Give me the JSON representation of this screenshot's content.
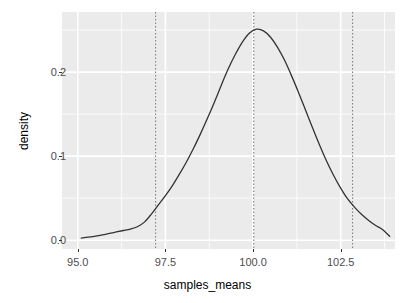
{
  "chart_data": {
    "type": "line",
    "title": "",
    "subtitle": "",
    "xlabel": "samples_means",
    "ylabel": "density",
    "xlim": [
      94.55,
      104.05
    ],
    "ylim": [
      -0.0105,
      0.2715
    ],
    "xticks": [
      95.0,
      97.5,
      100.0,
      102.5
    ],
    "xtick_labels": [
      "95.0",
      "97.5",
      "100.0",
      "102.5"
    ],
    "yticks": [
      0.0,
      0.1,
      0.2
    ],
    "ytick_labels": [
      "0.0",
      "0.1",
      "0.2"
    ],
    "grid": true,
    "grid_color": "#ffffff",
    "panel_background": "#ebebeb",
    "legend": "none",
    "series": [
      {
        "name": "density",
        "type": "line",
        "color": "#333333",
        "linewidth": 1.3,
        "x": [
          95.1,
          95.3,
          95.5,
          95.7,
          95.9,
          96.1,
          96.3,
          96.5,
          96.7,
          96.9,
          97.1,
          97.3,
          97.5,
          97.7,
          97.9,
          98.1,
          98.3,
          98.5,
          98.7,
          98.9,
          99.1,
          99.3,
          99.5,
          99.7,
          99.9,
          100.1,
          100.3,
          100.5,
          100.7,
          100.9,
          101.1,
          101.3,
          101.5,
          101.7,
          101.9,
          102.1,
          102.3,
          102.5,
          102.7,
          102.9,
          103.1,
          103.3,
          103.5,
          103.7,
          103.9
        ],
        "y": [
          0.0025,
          0.0035,
          0.0048,
          0.0062,
          0.008,
          0.0098,
          0.0115,
          0.0132,
          0.016,
          0.0215,
          0.031,
          0.042,
          0.053,
          0.065,
          0.0785,
          0.093,
          0.109,
          0.1265,
          0.145,
          0.1645,
          0.185,
          0.2045,
          0.2215,
          0.236,
          0.2465,
          0.251,
          0.249,
          0.2415,
          0.2295,
          0.214,
          0.1955,
          0.1755,
          0.1545,
          0.1335,
          0.113,
          0.094,
          0.077,
          0.062,
          0.049,
          0.039,
          0.0305,
          0.0235,
          0.0175,
          0.0125,
          0.0045
        ]
      }
    ],
    "reference_lines": [
      {
        "name": "lower-bound",
        "orientation": "vertical",
        "x": 97.22,
        "style": "dotted",
        "color": "#808080"
      },
      {
        "name": "mean",
        "orientation": "vertical",
        "x": 100.02,
        "style": "dotted",
        "color": "#808080"
      },
      {
        "name": "upper-bound",
        "orientation": "vertical",
        "x": 102.84,
        "style": "dotted",
        "color": "#808080"
      }
    ]
  }
}
